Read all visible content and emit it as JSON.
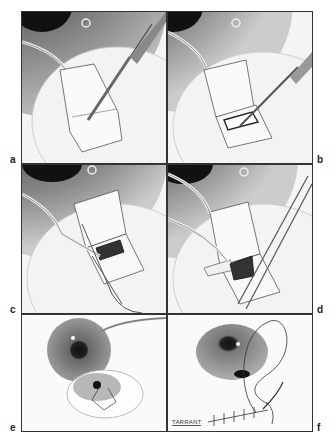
{
  "figure": {
    "panels": [
      {
        "id": "a",
        "label": "a",
        "content": "Forceps lift a rectangular scleral flap near the limbus while a blade incises the flap edge"
      },
      {
        "id": "b",
        "label": "b",
        "content": "Forceps hold the flap reflected; blade cuts a rectangular inner window in the bed"
      },
      {
        "id": "c",
        "label": "c",
        "content": "Flap reflected with forceps; dark tissue block excised with scissors"
      },
      {
        "id": "d",
        "label": "d",
        "content": "Two forceps manipulate the dark tissue block beneath the reflected flap"
      },
      {
        "id": "e",
        "label": "e",
        "content": "Whole eye with cannula; inset magnified view of the flap with sutures"
      },
      {
        "id": "f",
        "label": "f",
        "content": "Eye with curved needle and running suture closing incision"
      }
    ],
    "signature": "TARRANT"
  }
}
